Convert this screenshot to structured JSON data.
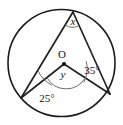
{
  "diagram": {
    "kind": "circle-geometry",
    "background_color": "#ffffff",
    "stroke_color": "#222222",
    "arc_color": "#6e6e6e",
    "circle": {
      "center_x": 61.5,
      "center_y": 63,
      "radius": 53.5
    },
    "points": {
      "apex": {
        "x": 73,
        "y": 12,
        "name": "top-vertex"
      },
      "left": {
        "x": 21,
        "y": 98,
        "name": "lower-left-vertex"
      },
      "right": {
        "x": 110,
        "y": 94,
        "name": "lower-right-vertex"
      },
      "center": {
        "x": 64,
        "y": 64,
        "name": "circle-center"
      }
    },
    "labels": {
      "center": "O",
      "apex_angle": "x",
      "central_angle": "y",
      "left_angle": "25°",
      "right_angle": "35°"
    },
    "label_positions": {
      "center": {
        "x": 62,
        "y": 55
      },
      "apex_angle": {
        "x": 73,
        "y": 23
      },
      "central_angle": {
        "x": 63,
        "y": 76
      },
      "left_angle": {
        "x": 47,
        "y": 99
      },
      "right_angle": {
        "x": 92,
        "y": 71
      }
    }
  }
}
